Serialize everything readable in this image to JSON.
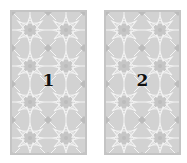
{
  "cards": [
    {
      "label": "1",
      "position": "left"
    },
    {
      "label": "2",
      "position": "right"
    }
  ],
  "colors": {
    "background": "#ffffff",
    "card_fill": "#d2d2d2",
    "card_border": "#c4c4c4",
    "pattern_lines": "#f4f4f4",
    "pattern_accent": "#bcbcbc",
    "label": "#111111"
  },
  "icons": {
    "card_back_pattern": "geometric-star-pattern"
  }
}
